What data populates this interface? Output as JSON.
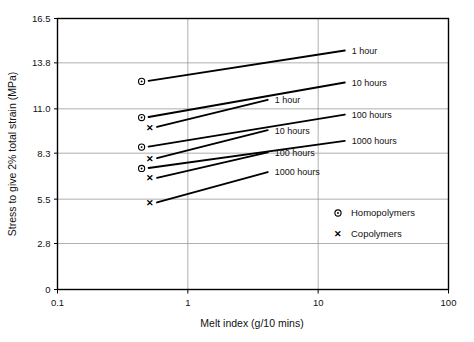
{
  "chart_data": {
    "type": "line",
    "title": "",
    "xlabel": "Melt index (g/10 mins)",
    "ylabel": "Stress to give 2% total strain (MPa)",
    "xscale": "log",
    "yscale": "linear",
    "xlim": [
      0.1,
      100
    ],
    "ylim": [
      0,
      16.5
    ],
    "xticks": [
      0.1,
      1,
      10,
      100
    ],
    "xtick_labels": [
      "0.1",
      "1",
      "10",
      "100"
    ],
    "yticks": [
      0,
      2.8,
      5.5,
      8.3,
      11.0,
      13.8,
      16.5
    ],
    "ytick_labels": [
      "0",
      "2.8",
      "5.5",
      "8.3",
      "11.0",
      "13.8",
      "16.5"
    ],
    "grid": "horizontal-and-vertical",
    "legend_position": "inside-lower-right",
    "legend": [
      {
        "marker": "circle-dot-marker",
        "glyph": "⊙",
        "label": "Homopolymers"
      },
      {
        "marker": "cross-marker",
        "glyph": "✕",
        "label": "Copolymers"
      }
    ],
    "series": [
      {
        "name": "Homopolymer 1 hour",
        "group": "Homopolymers",
        "marker": "circle-dot-marker",
        "label": "1 hour",
        "label_side": "right",
        "x": [
          0.5,
          16.0
        ],
        "y": [
          12.7,
          14.55
        ]
      },
      {
        "name": "Homopolymer 10 hours",
        "group": "Homopolymers",
        "marker": "circle-dot-marker",
        "label": "10 hours",
        "label_side": "right",
        "x": [
          0.5,
          16.0
        ],
        "y": [
          10.5,
          12.6
        ]
      },
      {
        "name": "Homopolymer 100 hours",
        "group": "Homopolymers",
        "marker": "circle-dot-marker",
        "label": "100 hours",
        "label_side": "right",
        "x": [
          0.5,
          16.0
        ],
        "y": [
          8.7,
          10.65
        ]
      },
      {
        "name": "Homopolymer 1000 hours",
        "group": "Homopolymers",
        "marker": "circle-dot-marker",
        "label": "1000 hours",
        "label_side": "right",
        "x": [
          0.5,
          16.0
        ],
        "y": [
          7.4,
          9.05
        ]
      },
      {
        "name": "Copolymer 1 hour",
        "group": "Copolymers",
        "marker": "cross-marker",
        "label": "1 hour",
        "label_side": "middle",
        "x": [
          0.58,
          4.1
        ],
        "y": [
          9.9,
          11.55
        ]
      },
      {
        "name": "Copolymer 10 hours",
        "group": "Copolymers",
        "marker": "cross-marker",
        "label": "10 hours",
        "label_side": "middle",
        "x": [
          0.58,
          4.1
        ],
        "y": [
          8.0,
          9.7
        ]
      },
      {
        "name": "Copolymer 100 hours",
        "group": "Copolymers",
        "marker": "cross-marker",
        "label": "100 hours",
        "label_side": "middle",
        "x": [
          0.58,
          4.1
        ],
        "y": [
          6.8,
          8.35
        ]
      },
      {
        "name": "Copolymer 1000 hours",
        "group": "Copolymers",
        "marker": "cross-marker",
        "label": "1000 hours",
        "label_side": "middle",
        "x": [
          0.58,
          4.1
        ],
        "y": [
          5.3,
          7.15
        ]
      }
    ],
    "colors": {
      "line": "#000000",
      "grid": "#9a9a9a",
      "frame": "#000000",
      "text": "#111111",
      "background": "#ffffff"
    }
  }
}
